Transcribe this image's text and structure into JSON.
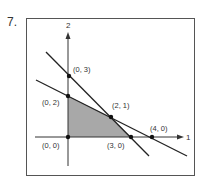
{
  "problem": {
    "number": "7."
  },
  "colors": {
    "frame": "#555555",
    "line": "#222222",
    "axis": "#333333",
    "feasible_region": "#a8a8a8",
    "point": "#111111",
    "text": "#333333"
  },
  "axes": {
    "x_label": "1",
    "y_label": "2"
  },
  "points": [
    {
      "label": "(0, 0)",
      "x": 0,
      "y": 0
    },
    {
      "label": "(0, 2)",
      "x": 0,
      "y": 2
    },
    {
      "label": "(0, 3)",
      "x": 0,
      "y": 3
    },
    {
      "label": "(2, 1)",
      "x": 2,
      "y": 1
    },
    {
      "label": "(3, 0)",
      "x": 3,
      "y": 0
    },
    {
      "label": "(4, 0)",
      "x": 4,
      "y": 0
    }
  ],
  "lines": [
    {
      "name": "steep-constraint",
      "through": [
        "(0, 3)",
        "(2, 1)",
        "(3, 0)"
      ]
    },
    {
      "name": "shallow-constraint",
      "through": [
        "(0, 2)",
        "(2, 1)",
        "(4, 0)"
      ]
    }
  ],
  "feasible_region": {
    "vertices": [
      "(0, 0)",
      "(0, 2)",
      "(2, 1)",
      "(3, 0)"
    ]
  }
}
